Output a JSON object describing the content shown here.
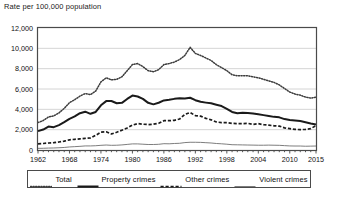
{
  "chart_data": {
    "type": "line",
    "title": "Rate per 100,000 population",
    "xlabel": "",
    "ylabel": "Rate per 100,000 population",
    "xlim": [
      1962,
      2015
    ],
    "ylim": [
      0,
      12000
    ],
    "ytick_labels": [
      "12,000",
      "10,000",
      "8,000",
      "6,000",
      "4,000",
      "2,000",
      "0"
    ],
    "ytick_values": [
      12000,
      10000,
      8000,
      6000,
      4000,
      2000,
      0
    ],
    "xtick_labels": [
      "1962",
      "1968",
      "1974",
      "1980",
      "1986",
      "1992",
      "1998",
      "2004",
      "2010",
      "2015"
    ],
    "xtick_values": [
      1962,
      1968,
      1974,
      1980,
      1986,
      1992,
      1998,
      2004,
      2010,
      2015
    ],
    "grid": true,
    "legend_position": "bottom",
    "x": [
      1962,
      1963,
      1964,
      1965,
      1966,
      1967,
      1968,
      1969,
      1970,
      1971,
      1972,
      1973,
      1974,
      1975,
      1976,
      1977,
      1978,
      1979,
      1980,
      1981,
      1982,
      1983,
      1984,
      1985,
      1986,
      1987,
      1988,
      1989,
      1990,
      1991,
      1992,
      1993,
      1994,
      1995,
      1996,
      1997,
      1998,
      1999,
      2000,
      2001,
      2002,
      2003,
      2004,
      2005,
      2006,
      2007,
      2008,
      2009,
      2010,
      2011,
      2012,
      2013,
      2014,
      2015
    ],
    "series": [
      {
        "name": "Total",
        "style": "dotted",
        "color": "#3c3c3c",
        "values": [
          2700,
          2900,
          3250,
          3350,
          3650,
          4100,
          4650,
          4950,
          5300,
          5550,
          5450,
          5800,
          6700,
          7100,
          6900,
          6950,
          7200,
          7800,
          8400,
          8500,
          8200,
          7800,
          7700,
          7900,
          8400,
          8500,
          8650,
          8900,
          9300,
          10100,
          9500,
          9300,
          9050,
          8800,
          8400,
          8100,
          7800,
          7400,
          7300,
          7300,
          7300,
          7200,
          7100,
          6950,
          6800,
          6650,
          6400,
          6050,
          5700,
          5500,
          5400,
          5200,
          5100,
          5200
        ]
      },
      {
        "name": "Property crimes",
        "style": "solid-thick",
        "color": "#1a1a1a",
        "values": [
          1860,
          2010,
          2300,
          2250,
          2450,
          2740,
          3070,
          3300,
          3620,
          3770,
          3560,
          3740,
          4400,
          4810,
          4820,
          4600,
          4640,
          5020,
          5350,
          5260,
          5030,
          4640,
          4490,
          4650,
          4880,
          4940,
          5030,
          5080,
          5070,
          5140,
          4900,
          4740,
          4660,
          4590,
          4450,
          4320,
          4050,
          3740,
          3620,
          3660,
          3630,
          3590,
          3510,
          3430,
          3350,
          3260,
          3210,
          3040,
          2950,
          2900,
          2860,
          2730,
          2600,
          2500
        ]
      },
      {
        "name": "Other crimes",
        "style": "dashed",
        "color": "#1a1a1a",
        "values": [
          600,
          640,
          690,
          720,
          790,
          870,
          1000,
          1050,
          1100,
          1150,
          1180,
          1440,
          1750,
          1790,
          1580,
          1740,
          1950,
          2160,
          2450,
          2600,
          2540,
          2500,
          2540,
          2630,
          2880,
          2880,
          2920,
          3050,
          3500,
          3690,
          3380,
          3330,
          3110,
          2970,
          2760,
          2690,
          2700,
          2620,
          2600,
          2600,
          2620,
          2520,
          2590,
          2490,
          2440,
          2380,
          2350,
          2180,
          2100,
          2030,
          2000,
          2030,
          2100,
          2400
        ]
      },
      {
        "name": "Violent crimes",
        "style": "solid-thin",
        "color": "#6e6e6e",
        "values": [
          160,
          170,
          190,
          200,
          220,
          250,
          300,
          330,
          360,
          400,
          400,
          420,
          460,
          490,
          460,
          470,
          500,
          550,
          600,
          600,
          570,
          540,
          540,
          560,
          620,
          610,
          640,
          660,
          730,
          760,
          760,
          750,
          720,
          690,
          640,
          610,
          570,
          520,
          510,
          500,
          490,
          480,
          470,
          470,
          480,
          470,
          460,
          430,
          400,
          390,
          390,
          370,
          380,
          390
        ]
      }
    ]
  },
  "legend": {
    "items": [
      {
        "label": "Total",
        "style": "dotted"
      },
      {
        "label": "Property crimes",
        "style": "solid-thick"
      },
      {
        "label": "Other crimes",
        "style": "dashed"
      },
      {
        "label": "Violent crimes",
        "style": "solid-thin"
      }
    ]
  }
}
